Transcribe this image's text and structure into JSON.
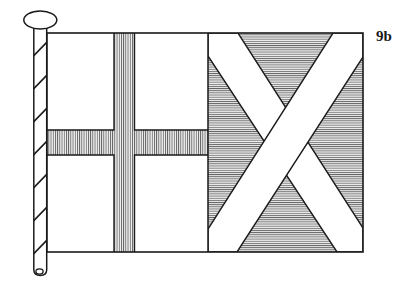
{
  "figure": {
    "label": "9b",
    "label_position": "top-right",
    "background_color": "#ffffff",
    "line_color": "#1a1a1a"
  },
  "flagpole": {
    "name": "flagpole",
    "finial": {
      "name": "pole-finial",
      "shape": "ellipse",
      "fill": "#ffffff"
    },
    "shaft": {
      "fill": "#ffffff",
      "hatching": "diagonal-slashes",
      "hatch_color": "#1a1a1a"
    },
    "foot": {
      "name": "pole-foot",
      "shape": "rounded-end"
    }
  },
  "flag": {
    "name": "flag-banner",
    "outline_color": "#1a1a1a",
    "hoist_field": {
      "name": "hoist-field",
      "fill": "#ffffff",
      "charge": "nordic-cross",
      "cross": {
        "name": "nordic-cross",
        "fill": "#f0f0f0",
        "hatching": "vertical-lines",
        "hatch_color": "#555555"
      }
    },
    "fly_field": {
      "name": "fly-field",
      "fill": "#e8e8e8",
      "hatching": "horizontal-lines",
      "hatch_color": "#555555",
      "charge": "saltire",
      "saltire": {
        "name": "saltire-cross",
        "fill": "#ffffff"
      }
    }
  }
}
